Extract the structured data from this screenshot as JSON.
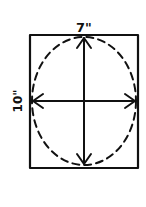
{
  "diagram": {
    "type": "hand-drawn dimension sketch",
    "shapes": [
      {
        "name": "rectangle",
        "style": "solid"
      },
      {
        "name": "ellipse",
        "style": "dashed",
        "inscribed_in": "rectangle"
      }
    ],
    "width_label": "7\"",
    "height_label": "10\"",
    "arrows": [
      {
        "name": "horizontal",
        "direction": "double-headed",
        "measures": "width"
      },
      {
        "name": "vertical",
        "direction": "double-headed",
        "measures": "height"
      }
    ],
    "colors": {
      "ink": "#111111",
      "background": "#ffffff"
    }
  }
}
